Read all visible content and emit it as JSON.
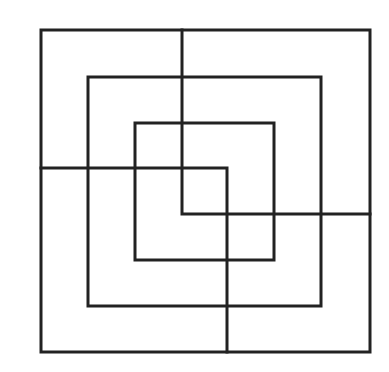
{
  "diagram": {
    "type": "nested-squares-line-puzzle",
    "canvas": {
      "width": 389,
      "height": 372,
      "background": "#ffffff"
    },
    "stroke": {
      "color": "#222222",
      "width": 3
    },
    "squares": [
      {
        "name": "outer-square",
        "x1": 41,
        "y1": 30,
        "x2": 370,
        "y2": 352
      },
      {
        "name": "middle-square",
        "x1": 88,
        "y1": 77,
        "x2": 321,
        "y2": 306
      },
      {
        "name": "inner-square",
        "x1": 135,
        "y1": 123,
        "x2": 274,
        "y2": 260
      }
    ],
    "paths": [
      {
        "name": "l-path-horizontal-then-down",
        "points": [
          [
            41,
            168
          ],
          [
            227,
            168
          ],
          [
            227,
            352
          ]
        ]
      },
      {
        "name": "l-path-vertical-then-right",
        "points": [
          [
            182,
            30
          ],
          [
            182,
            214
          ],
          [
            370,
            214
          ]
        ]
      }
    ]
  }
}
